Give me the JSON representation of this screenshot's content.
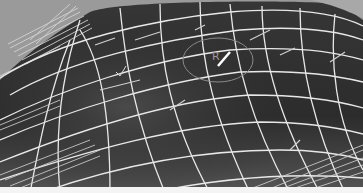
{
  "scene": {
    "description": "3D wireframe render of a curved surface mesh with white grid lines over a dark shaded surface",
    "colors": {
      "background": "#9a9a9a",
      "surface_dark": "#2e2e2e",
      "surface_mid": "#3c3c3c",
      "wire": "#e8e8e8",
      "gizmo": "#8a8a8a"
    },
    "gizmo": {
      "label": "R",
      "shape": "circle"
    },
    "bottom_strip": "white"
  }
}
